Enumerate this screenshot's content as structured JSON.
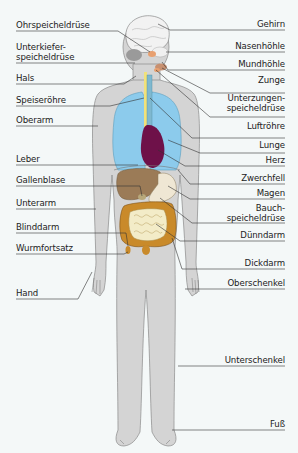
{
  "diagram": {
    "type": "anatomical-diagram",
    "colors": {
      "background": "#f4f8f8",
      "body": "#d4d4d4",
      "lungs": "#8ccbec",
      "heart": "#6e1149",
      "liver": "#9b7b57",
      "intestines": "#c98a2a",
      "small_intestine": "#f3ecc8",
      "brain": "#f2f2f2",
      "trachea": "#7fb8cf",
      "esophagus": "#f2e27a"
    },
    "labels_left": [
      {
        "id": "ohrspeicheldruese",
        "text": "Ohrspeicheldrüse"
      },
      {
        "id": "unterkieferspeicheldruese",
        "line1": "Unterkiefer-",
        "line2": "speicheldrüse"
      },
      {
        "id": "hals",
        "text": "Hals"
      },
      {
        "id": "speiseroehre",
        "text": "Speiseröhre"
      },
      {
        "id": "oberarm",
        "text": "Oberarm"
      },
      {
        "id": "leber",
        "text": "Leber"
      },
      {
        "id": "gallenblase",
        "text": "Gallenblase"
      },
      {
        "id": "unterarm",
        "text": "Unterarm"
      },
      {
        "id": "blinddarm",
        "text": "Blinddarm"
      },
      {
        "id": "wurmfortsatz",
        "text": "Wurmfortsatz"
      },
      {
        "id": "hand",
        "text": "Hand"
      }
    ],
    "labels_right": [
      {
        "id": "gehirn",
        "text": "Gehirn"
      },
      {
        "id": "nasenhoehle",
        "text": "Nasenhöhle"
      },
      {
        "id": "mundhoehle",
        "text": "Mundhöhle"
      },
      {
        "id": "zunge",
        "text": "Zunge"
      },
      {
        "id": "unterzungenspeicheldruese",
        "line1": "Unterzungen-",
        "line2": "speicheldrüse"
      },
      {
        "id": "luftroehre",
        "text": "Luftröhre"
      },
      {
        "id": "lunge",
        "text": "Lunge"
      },
      {
        "id": "herz",
        "text": "Herz"
      },
      {
        "id": "zwerchfell",
        "text": "Zwerchfell"
      },
      {
        "id": "magen",
        "text": "Magen"
      },
      {
        "id": "bauchspeicheldruese",
        "line1": "Bauch-",
        "line2": "speicheldrüse"
      },
      {
        "id": "duenndarm",
        "text": "Dünndarm"
      },
      {
        "id": "dickdarm",
        "text": "Dickdarm"
      },
      {
        "id": "oberschenkel",
        "text": "Oberschenkel"
      },
      {
        "id": "unterschenkel",
        "text": "Unterschenkel"
      },
      {
        "id": "fuss",
        "text": "Fuß"
      }
    ]
  }
}
